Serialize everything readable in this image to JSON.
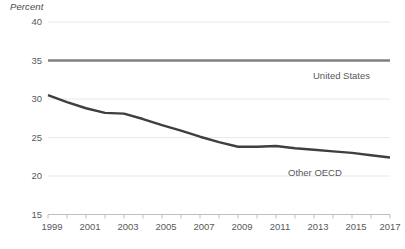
{
  "chart_data": {
    "type": "line",
    "title": "",
    "xlabel": "",
    "ylabel": "Percent",
    "ylim": [
      15,
      40
    ],
    "yticks": [
      15,
      20,
      25,
      30,
      35,
      40
    ],
    "xlim": [
      1999,
      2017
    ],
    "xticks": [
      1999,
      2000,
      2001,
      2002,
      2003,
      2004,
      2005,
      2006,
      2007,
      2008,
      2009,
      2010,
      2011,
      2012,
      2013,
      2014,
      2015,
      2016,
      2017
    ],
    "xtick_labels": [
      "1999",
      "",
      "2001",
      "",
      "2003",
      "",
      "2005",
      "",
      "2007",
      "",
      "2009",
      "",
      "2011",
      "",
      "2013",
      "",
      "2015",
      "",
      "2017"
    ],
    "grid": true,
    "grid_axis": "y",
    "legend": "inline-annotations",
    "x": [
      1999,
      2000,
      2001,
      2002,
      2003,
      2004,
      2005,
      2006,
      2007,
      2008,
      2009,
      2010,
      2011,
      2012,
      2013,
      2014,
      2015,
      2016,
      2017
    ],
    "series": [
      {
        "name": "United States",
        "color": "#808080",
        "values": [
          35.0,
          35.0,
          35.0,
          35.0,
          35.0,
          35.0,
          35.0,
          35.0,
          35.0,
          35.0,
          35.0,
          35.0,
          35.0,
          35.0,
          35.0,
          35.0,
          35.0,
          35.0,
          35.0
        ]
      },
      {
        "name": "Other OECD",
        "color": "#3f3f3f",
        "values": [
          30.5,
          29.6,
          28.8,
          28.2,
          28.1,
          27.4,
          26.6,
          25.9,
          25.1,
          24.4,
          23.8,
          23.8,
          23.9,
          23.6,
          23.4,
          23.2,
          23.0,
          22.7,
          22.4
        ]
      }
    ],
    "annotations": [
      {
        "text": "United States",
        "series": "United States"
      },
      {
        "text": "Other OECD",
        "series": "Other OECD"
      }
    ]
  },
  "axis": {
    "y_title": "Percent",
    "y_labels": [
      "40",
      "35",
      "30",
      "25",
      "20",
      "15"
    ],
    "x_labels": [
      "1999",
      "2001",
      "2003",
      "2005",
      "2007",
      "2009",
      "2011",
      "2013",
      "2015",
      "2017"
    ]
  },
  "colors": {
    "united_states_line": "#808080",
    "other_oecd_line": "#3f3f3f",
    "gridline": "#e9e9e9",
    "axis_line": "#bfbfbf",
    "tick_text": "#595959"
  }
}
